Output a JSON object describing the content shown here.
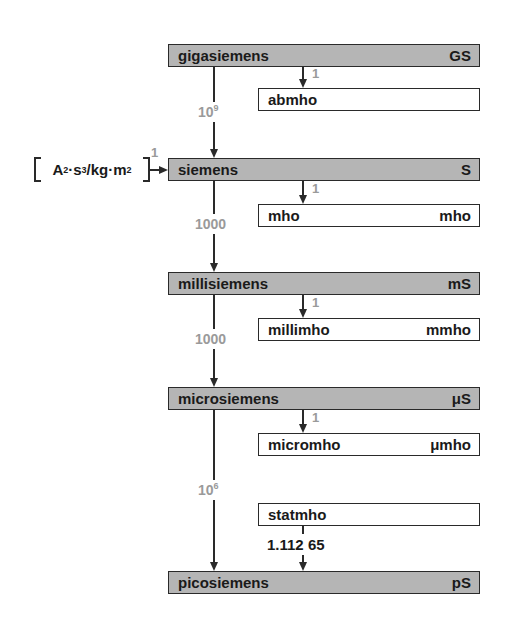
{
  "units": [
    {
      "name": "gigasiemens",
      "symbol": "GS"
    },
    {
      "name": "siemens",
      "symbol": "S"
    },
    {
      "name": "millisiemens",
      "symbol": "mS"
    },
    {
      "name": "microsiemens",
      "symbol": "μS"
    },
    {
      "name": "picosiemens",
      "symbol": "pS"
    }
  ],
  "equivalents": [
    {
      "name": "abmho",
      "symbol": "",
      "factor": "1"
    },
    {
      "name": "mho",
      "symbol": "mho",
      "factor": "1"
    },
    {
      "name": "millimho",
      "symbol": "mmho",
      "factor": "1"
    },
    {
      "name": "micromho",
      "symbol": "μmho",
      "factor": "1"
    },
    {
      "name": "statmho",
      "symbol": "",
      "factor": "1.112 65"
    }
  ],
  "main_factors": [
    {
      "base": "10",
      "exp": "9"
    },
    {
      "base": "1000",
      "exp": ""
    },
    {
      "base": "1000",
      "exp": ""
    },
    {
      "base": "10",
      "exp": "6"
    }
  ],
  "si_base": {
    "bracket_parts": [
      "A",
      "2",
      "·s",
      "3",
      "/kg·m",
      "2"
    ],
    "factor": "1"
  },
  "colors": {
    "primary_box": "#b5b5b5",
    "factor_text": "#9a9a9a",
    "lines": "#2a2a2a"
  }
}
